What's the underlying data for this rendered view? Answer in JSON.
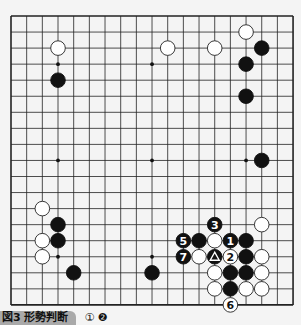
{
  "board": {
    "size": 19,
    "origin_x": 11,
    "origin_y": 16,
    "spacing_x": 15.67,
    "spacing_y": 16.05,
    "line_color": "#222222",
    "board_color": "#f4f4f4",
    "star_points": [
      [
        3,
        3
      ],
      [
        9,
        3
      ],
      [
        15,
        3
      ],
      [
        3,
        9
      ],
      [
        9,
        9
      ],
      [
        15,
        9
      ],
      [
        3,
        15
      ],
      [
        9,
        15
      ],
      [
        15,
        15
      ]
    ],
    "stones": [
      {
        "color": "white",
        "col": 3,
        "row": 2
      },
      {
        "color": "black",
        "col": 3,
        "row": 4
      },
      {
        "color": "white",
        "col": 10,
        "row": 2
      },
      {
        "color": "white",
        "col": 13,
        "row": 2
      },
      {
        "color": "white",
        "col": 15,
        "row": 1
      },
      {
        "color": "black",
        "col": 16,
        "row": 2
      },
      {
        "color": "black",
        "col": 15,
        "row": 3
      },
      {
        "color": "black",
        "col": 15,
        "row": 5
      },
      {
        "color": "black",
        "col": 16,
        "row": 9
      },
      {
        "color": "white",
        "col": 2,
        "row": 12
      },
      {
        "color": "black",
        "col": 3,
        "row": 13
      },
      {
        "color": "white",
        "col": 2,
        "row": 14
      },
      {
        "color": "black",
        "col": 3,
        "row": 14
      },
      {
        "color": "white",
        "col": 2,
        "row": 15
      },
      {
        "color": "black",
        "col": 4,
        "row": 16
      },
      {
        "color": "black",
        "col": 9,
        "row": 16
      },
      {
        "color": "white",
        "col": 16,
        "row": 13
      },
      {
        "color": "black",
        "col": 13,
        "row": 13,
        "label": "3"
      },
      {
        "color": "black",
        "col": 11,
        "row": 14,
        "label": "5"
      },
      {
        "color": "black",
        "col": 12,
        "row": 14
      },
      {
        "color": "white",
        "col": 13,
        "row": 14
      },
      {
        "color": "black",
        "col": 14,
        "row": 14,
        "label": "1"
      },
      {
        "color": "black",
        "col": 15,
        "row": 14
      },
      {
        "color": "black",
        "col": 11,
        "row": 15,
        "label": "7"
      },
      {
        "color": "white",
        "col": 12,
        "row": 15
      },
      {
        "color": "black",
        "col": 13,
        "row": 15,
        "label": "△"
      },
      {
        "color": "white",
        "col": 14,
        "row": 15,
        "label": "2"
      },
      {
        "color": "black",
        "col": 15,
        "row": 15
      },
      {
        "color": "white",
        "col": 16,
        "row": 15
      },
      {
        "color": "white",
        "col": 13,
        "row": 16
      },
      {
        "color": "black",
        "col": 14,
        "row": 16
      },
      {
        "color": "black",
        "col": 15,
        "row": 16
      },
      {
        "color": "white",
        "col": 16,
        "row": 16
      },
      {
        "color": "white",
        "col": 13,
        "row": 17
      },
      {
        "color": "black",
        "col": 14,
        "row": 17
      },
      {
        "color": "white",
        "col": 15,
        "row": 17
      },
      {
        "color": "white",
        "col": 16,
        "row": 17
      },
      {
        "color": "white",
        "col": 14,
        "row": 18,
        "label": "6"
      }
    ]
  },
  "caption": {
    "tag": "図3 形勢判断",
    "moves": "①  ❷"
  }
}
